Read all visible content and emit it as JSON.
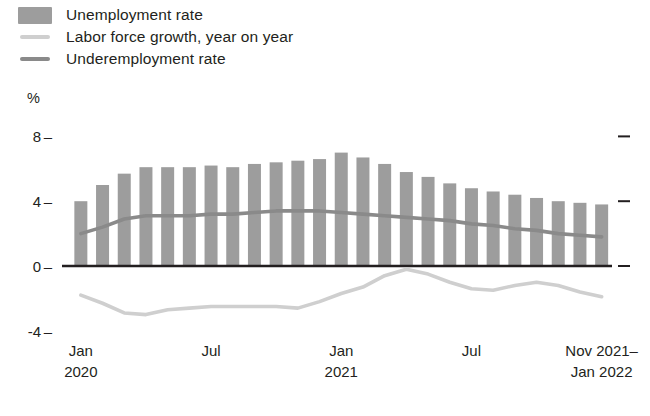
{
  "legend": {
    "items": [
      {
        "label": "Unemployment rate",
        "marker": "bar-swatch",
        "color": "#9d9d9d"
      },
      {
        "label": "Labor force growth, year on year",
        "marker": "line-swatch",
        "color": "#cfcfcf"
      },
      {
        "label": "Underemployment rate",
        "marker": "line-swatch",
        "color": "#8a8a8a"
      }
    ]
  },
  "axis": {
    "unit": "%",
    "y_ticks": [
      "8",
      "4",
      "0",
      "-4"
    ],
    "x_ticks": [
      {
        "line1": "Jan",
        "line2": "2020"
      },
      {
        "line1": "Jul",
        "line2": ""
      },
      {
        "line1": "Jan",
        "line2": "2021"
      },
      {
        "line1": "Jul",
        "line2": ""
      },
      {
        "line1": "Nov 2021–",
        "line2": "Jan 2022"
      }
    ]
  },
  "chart_data": {
    "type": "bar",
    "title": "",
    "xlabel": "",
    "ylabel": "%",
    "ylim": [
      -4,
      8
    ],
    "yticks": [
      -4,
      0,
      4,
      8
    ],
    "grid": false,
    "legend_position": "top-left",
    "categories": [
      "Jan 2020",
      "Feb 2020",
      "Mar 2020",
      "Apr 2020",
      "May 2020",
      "Jun 2020",
      "Jul 2020",
      "Aug 2020",
      "Sep 2020",
      "Oct 2020",
      "Nov 2020",
      "Dec 2020",
      "Jan 2021",
      "Feb 2021",
      "Mar 2021",
      "Apr 2021",
      "May 2021",
      "Jun 2021",
      "Jul 2021",
      "Aug 2021",
      "Sep 2021",
      "Oct 2021",
      "Nov 2021",
      "Dec 2021",
      "Jan 2022"
    ],
    "series": [
      {
        "name": "Unemployment rate",
        "type": "bar",
        "color": "#9d9d9d",
        "values": [
          4.0,
          5.0,
          5.7,
          6.1,
          6.1,
          6.1,
          6.2,
          6.1,
          6.3,
          6.4,
          6.5,
          6.6,
          7.0,
          6.7,
          6.3,
          5.8,
          5.5,
          5.1,
          4.8,
          4.6,
          4.4,
          4.2,
          4.0,
          3.9,
          3.8
        ]
      },
      {
        "name": "Labor force growth, year on year",
        "type": "line",
        "color": "#cfcfcf",
        "values": [
          -1.8,
          -2.3,
          -2.9,
          -3.0,
          -2.7,
          -2.6,
          -2.5,
          -2.5,
          -2.5,
          -2.5,
          -2.6,
          -2.2,
          -1.7,
          -1.3,
          -0.6,
          -0.2,
          -0.5,
          -1.0,
          -1.4,
          -1.5,
          -1.2,
          -1.0,
          -1.2,
          -1.6,
          -1.9
        ]
      },
      {
        "name": "Underemployment rate",
        "type": "line",
        "color": "#8a8a8a",
        "values": [
          2.0,
          2.4,
          2.9,
          3.1,
          3.1,
          3.1,
          3.2,
          3.2,
          3.3,
          3.4,
          3.4,
          3.4,
          3.3,
          3.2,
          3.1,
          3.0,
          2.9,
          2.8,
          2.6,
          2.5,
          2.3,
          2.2,
          2.0,
          1.9,
          1.8
        ]
      }
    ]
  },
  "geometry": {
    "plot_left": 70,
    "plot_right": 612,
    "y_zero_px": 266,
    "px_per_unit": 16.2,
    "bar_width": 13,
    "bar_pitch": 21.7,
    "xtick_indices": [
      0,
      6,
      12,
      18,
      24
    ]
  }
}
